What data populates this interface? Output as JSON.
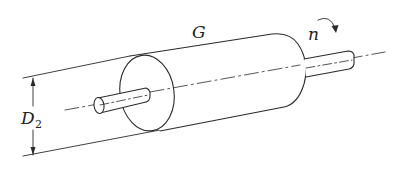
{
  "diagram": {
    "labels": {
      "weight": "G",
      "speed": "n",
      "diameter_main": "D",
      "diameter_sub": "2"
    },
    "colors": {
      "stroke": "#2a2a2a",
      "background": "#ffffff"
    }
  }
}
